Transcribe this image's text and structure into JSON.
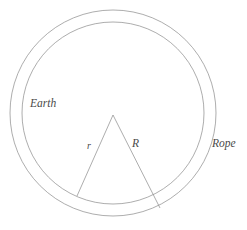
{
  "figure": {
    "width": 247,
    "height": 230,
    "background_color": "#ffffff",
    "stroke_color": "#8a8a8a",
    "label_color": "#4a4a4a"
  },
  "labels": {
    "earth": "Earth",
    "rope": "Rope",
    "radius_small": "r",
    "radius_large": "R"
  },
  "chart_data": {
    "type": "diagram",
    "center": {
      "x": 113,
      "y": 113
    },
    "circles": [
      {
        "name": "earth",
        "label": "Earth",
        "radius": 91,
        "stroke": "#8a8a8a",
        "stroke_width": 0.7,
        "fill": "none"
      },
      {
        "name": "rope",
        "label": "Rope",
        "radius": 103,
        "stroke": "#8a8a8a",
        "stroke_width": 0.7,
        "fill": "none"
      }
    ],
    "gap": 12,
    "apex": {
      "x": 113,
      "y": 115
    },
    "segments": [
      {
        "name": "radius-small",
        "label": "r",
        "from": {
          "x": 113,
          "y": 115
        },
        "to": {
          "x": 77,
          "y": 196
        },
        "terminates_at": "earth"
      },
      {
        "name": "radius-large",
        "label": "R",
        "from": {
          "x": 113,
          "y": 115
        },
        "to": {
          "x": 160,
          "y": 208
        },
        "terminates_at": "rope"
      }
    ],
    "label_positions": [
      {
        "text": "Earth",
        "x": 30,
        "y": 98
      },
      {
        "text": "Rope",
        "x": 212,
        "y": 138
      },
      {
        "text": "r",
        "x": 87,
        "y": 141
      },
      {
        "text": "R",
        "x": 132,
        "y": 138
      }
    ],
    "grid": false,
    "legend": false
  }
}
